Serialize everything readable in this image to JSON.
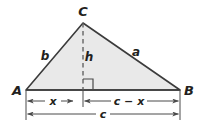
{
  "figure": {
    "type": "geometry-diagram",
    "vertices": [
      {
        "name": "A",
        "label": "A",
        "x": 26,
        "y": 90
      },
      {
        "name": "B",
        "label": "B",
        "x": 180,
        "y": 90
      },
      {
        "name": "C",
        "label": "C",
        "x": 83,
        "y": 23
      }
    ],
    "altitude": {
      "label": "h",
      "from_x": 83,
      "from_y": 23,
      "to_x": 83,
      "to_y": 90,
      "style": "dashed",
      "right_angle_marker": true
    },
    "sides": [
      {
        "name": "side-b",
        "label": "b",
        "between": "A-C"
      },
      {
        "name": "side-a",
        "label": "a",
        "between": "C-B"
      },
      {
        "name": "side-c",
        "label": "c",
        "between": "A-B"
      }
    ],
    "dimensions": [
      {
        "name": "segment-x",
        "label": "x",
        "from_x": 26,
        "to_x": 83,
        "y": 101
      },
      {
        "name": "segment-c-x",
        "label": "c − x",
        "from_x": 83,
        "to_x": 180,
        "y": 101
      },
      {
        "name": "segment-c-full",
        "label": "c",
        "from_x": 26,
        "to_x": 180,
        "y": 114
      }
    ],
    "labels": {
      "A": "A",
      "B": "B",
      "C": "C",
      "a": "a",
      "b": "b",
      "c": "c",
      "h": "h",
      "x": "x",
      "c_minus_x": "c − x",
      "c_full": "c"
    },
    "colors": {
      "fill": "#e9e9e9",
      "stroke": "#3b3b3b",
      "dimension": "#4a4a4a",
      "text": "#231f20",
      "background": "#ffffff"
    }
  }
}
